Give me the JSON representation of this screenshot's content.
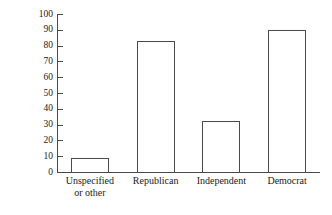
{
  "chart_data": {
    "type": "bar",
    "title": "",
    "subtitle": "",
    "xlabel": "",
    "ylabel": "Frequency",
    "categories": [
      "Unspecified\nor other",
      "Republican",
      "Independent",
      "Democrat"
    ],
    "values": [
      9,
      83,
      32,
      90
    ],
    "ylim": [
      0,
      100
    ],
    "ytick_labels": [
      "0",
      "10",
      "20",
      "30",
      "40",
      "50",
      "60",
      "70",
      "80",
      "90",
      "100"
    ],
    "ytick_values": [
      0,
      10,
      20,
      30,
      40,
      50,
      60,
      70,
      80,
      90,
      100
    ],
    "grid": false,
    "legend": false,
    "legend_position": "none",
    "bar_fill_color": "#ffffff",
    "bar_edge_color": "#4a4a4a",
    "axis_color": "#4a4a4a",
    "text_color": "#1a1a1a",
    "background_color": "#ffffff"
  }
}
